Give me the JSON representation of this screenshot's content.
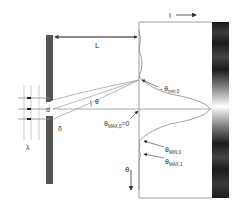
{
  "labels": {
    "intensity": "I",
    "distance": "L",
    "slit_width": "d",
    "angle": "θ",
    "path_diff": "δ",
    "wavelength": "λ",
    "theta_axis": "θ",
    "theta_min0_neg": "- θ",
    "theta_min0_neg_sub": "min,0",
    "theta_max0": "θ",
    "theta_max0_sub": "MAX,0",
    "theta_max0_eq": "=0",
    "theta_min0": "θ",
    "theta_min0_sub": "MIN,0",
    "theta_max1": "θ",
    "theta_max1_sub": "MAX,1"
  },
  "colors": {
    "barrier": "#555555",
    "lines": "#777777",
    "screen_pattern_dark": "#1a1a1a",
    "screen_pattern_bright": "#ffffff"
  }
}
